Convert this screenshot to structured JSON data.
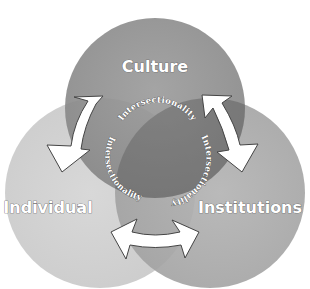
{
  "diagram": {
    "type": "venn-3",
    "circles": [
      {
        "id": "culture",
        "label": "Culture",
        "color": "#8e8e8e"
      },
      {
        "id": "individual",
        "label": "Individual",
        "color": "#cfcfcf"
      },
      {
        "id": "institutions",
        "label": "Institutions",
        "color": "#a8a8a8"
      }
    ],
    "center_labels": [
      {
        "position": "top",
        "text": "Intersectionality"
      },
      {
        "position": "left",
        "text": "Intersectionality"
      },
      {
        "position": "right",
        "text": "Intersectionality"
      }
    ],
    "arrows": [
      {
        "between": [
          "Culture",
          "Individual"
        ],
        "type": "bidirectional"
      },
      {
        "between": [
          "Culture",
          "Institutions"
        ],
        "type": "bidirectional"
      },
      {
        "between": [
          "Individual",
          "Institutions"
        ],
        "type": "bidirectional"
      }
    ]
  }
}
